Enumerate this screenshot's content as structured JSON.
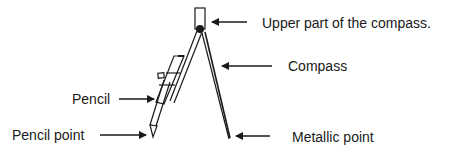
{
  "diagram": {
    "subject": "Compass",
    "colors": {
      "stroke": "#1a1a1a",
      "background": "#ffffff"
    },
    "labels": {
      "upper_part": "Upper part of the compass.",
      "compass": "Compass",
      "pencil": "Pencil",
      "pencil_point": "Pencil point",
      "metallic_point": "Metallic point"
    }
  }
}
